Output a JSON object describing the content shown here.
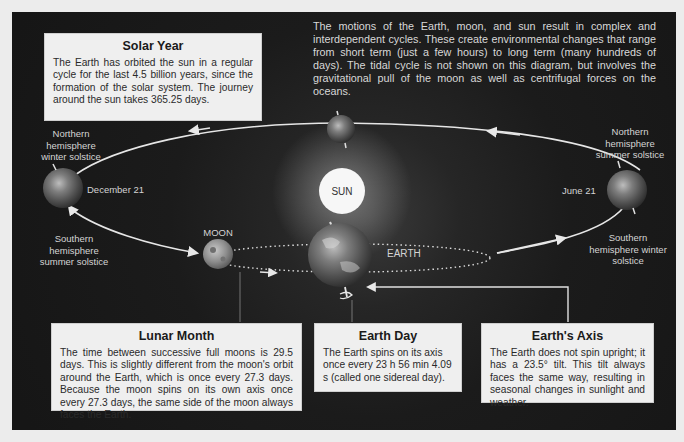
{
  "intro_text": "The motions of the Earth, moon, and sun result in complex and interdependent cycles. These create environmental changes that range from short term (just a few hours) to long term (many hundreds of days). The tidal cycle is not shown on this diagram, but involves the gravitational pull of the moon as well as centrifugal forces on the oceans.",
  "boxes": {
    "solar_year": {
      "title": "Solar Year",
      "body": "The Earth has orbited the sun in a regular cycle for the last 4.5 billion years, since the formation of the solar system. The journey around the sun takes 365.25 days."
    },
    "lunar_month": {
      "title": "Lunar Month",
      "body": "The time between successive full moons is 29.5 days. This is slightly different from the moon's orbit around the Earth, which is once every 27.3 days. Because the moon spins on its own axis once every 27.3 days, the same side of the moon always faces the Earth."
    },
    "earth_day": {
      "title": "Earth Day",
      "body": "The Earth spins on its axis once every 23 h 56 min 4.09 s (called one sidereal day)."
    },
    "earths_axis": {
      "title": "Earth's Axis",
      "body": "The Earth does not spin upright; it has a 23.5° tilt. This tilt always faces the same way, resulting in seasonal changes in sunlight and weather."
    }
  },
  "labels": {
    "north_winter": "Northern hemisphere winter solstice",
    "south_summer": "Southern hemisphere summer solstice",
    "north_summer": "Northern hemisphere summer solstice",
    "south_winter": "Southern hemisphere winter solstice",
    "december": "December 21",
    "june": "June 21",
    "sun": "SUN",
    "moon": "MOON",
    "earth": "EARTH"
  },
  "colors": {
    "panel_bg": "#1b1b1b",
    "box_bg": "#efefef",
    "orbit_line": "#e6e6e6",
    "sun": "#f7f7f7",
    "page_bg": "#ececec"
  }
}
